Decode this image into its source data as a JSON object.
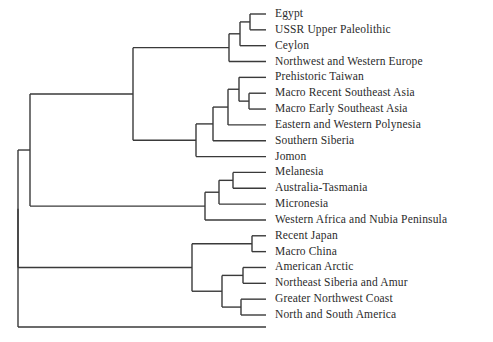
{
  "figure": {
    "type": "dendrogram",
    "orientation": "horizontal-right-facing",
    "background_color": "#ffffff",
    "line_color": "#3a3a3a",
    "text_color": "#2b2b2b",
    "leaf_count": 19
  },
  "leaves": [
    {
      "id": "egypt",
      "label": "Egypt"
    },
    {
      "id": "ussr-upper-paleolithic",
      "label": "USSR Upper Paleolithic"
    },
    {
      "id": "ceylon",
      "label": "Ceylon"
    },
    {
      "id": "northwest-and-western-europe",
      "label": "Northwest and Western Europe"
    },
    {
      "id": "prehistoric-taiwan",
      "label": "Prehistoric Taiwan"
    },
    {
      "id": "macro-recent-southeast-asia",
      "label": "Macro Recent Southeast Asia"
    },
    {
      "id": "macro-early-southeast-asia",
      "label": "Macro Early Southeast Asia"
    },
    {
      "id": "eastern-and-western-polynesia",
      "label": "Eastern and Western Polynesia"
    },
    {
      "id": "southern-siberia",
      "label": "Southern Siberia"
    },
    {
      "id": "jomon",
      "label": "Jomon"
    },
    {
      "id": "melanesia",
      "label": "Melanesia"
    },
    {
      "id": "australia-tasmania",
      "label": "Australia-Tasmania"
    },
    {
      "id": "micronesia",
      "label": "Micronesia"
    },
    {
      "id": "western-africa-and-nubia-peninsula",
      "label": "Western Africa and Nubia Peninsula"
    },
    {
      "id": "recent-japan",
      "label": "Recent Japan"
    },
    {
      "id": "macro-china",
      "label": "Macro China"
    },
    {
      "id": "american-arctic",
      "label": "American Arctic"
    },
    {
      "id": "northeast-siberia-and-amur",
      "label": "Northeast Siberia and Amur"
    },
    {
      "id": "greater-northwest-coast",
      "label": "Greater Northwest Coast"
    },
    {
      "id": "north-and-south-america",
      "label": "North and South America"
    }
  ],
  "chart_data": {
    "type": "dendrogram",
    "title": "",
    "xlabel": "",
    "ylabel": "",
    "leaf_order": [
      "Egypt",
      "USSR Upper Paleolithic",
      "Ceylon",
      "Northwest and Western Europe",
      "Prehistoric Taiwan",
      "Macro Recent Southeast Asia",
      "Macro Early Southeast Asia",
      "Eastern and Western Polynesia",
      "Southern Siberia",
      "Jomon",
      "Melanesia",
      "Australia-Tasmania",
      "Micronesia",
      "Western Africa and Nubia Peninsula",
      "Recent Japan",
      "Macro China",
      "American Arctic",
      "Northeast Siberia and Amur",
      "Greater Northwest Coast",
      "North and South America"
    ],
    "leaf_tip_x": 266,
    "leaf_y": [
      14,
      31,
      48,
      64,
      81,
      97,
      114,
      130,
      147,
      163,
      180,
      196,
      213,
      229,
      246,
      262,
      279,
      295,
      312,
      315
    ],
    "merges": [
      {
        "id": "n_egypt_ussr",
        "x": 250,
        "children": [
          "Egypt",
          "USSR Upper Paleolithic"
        ]
      },
      {
        "id": "n_ceylon",
        "x": 240,
        "children": [
          "n_egypt_ussr",
          "Ceylon"
        ]
      },
      {
        "id": "n_nweurope",
        "x": 229,
        "children": [
          "n_ceylon",
          "Northwest and Western Europe"
        ]
      },
      {
        "id": "n_sea_pair",
        "x": 249,
        "children": [
          "Macro Recent Southeast Asia",
          "Macro Early Southeast Asia"
        ]
      },
      {
        "id": "n_taiwan_sea",
        "x": 239,
        "children": [
          "Prehistoric Taiwan",
          "n_sea_pair"
        ]
      },
      {
        "id": "n_polynesia",
        "x": 228,
        "children": [
          "n_taiwan_sea",
          "Eastern and Western Polynesia"
        ]
      },
      {
        "id": "n_ssiberia",
        "x": 213,
        "children": [
          "n_polynesia",
          "Southern Siberia"
        ]
      },
      {
        "id": "n_jomon",
        "x": 196,
        "children": [
          "n_ssiberia",
          "Jomon"
        ]
      },
      {
        "id": "n_upper",
        "x": 133,
        "children": [
          "n_nweurope",
          "n_jomon"
        ]
      },
      {
        "id": "n_mel_aus",
        "x": 233,
        "children": [
          "Melanesia",
          "Australia-Tasmania"
        ]
      },
      {
        "id": "n_micronesia",
        "x": 219,
        "children": [
          "n_mel_aus",
          "Micronesia"
        ]
      },
      {
        "id": "n_wafrica",
        "x": 205,
        "children": [
          "n_micronesia",
          "Western Africa and Nubia Peninsula"
        ]
      },
      {
        "id": "n_clade_a",
        "x": 30,
        "children": [
          "n_upper",
          "n_wafrica"
        ]
      },
      {
        "id": "n_japan_china",
        "x": 252,
        "children": [
          "Recent Japan",
          "Macro China"
        ]
      },
      {
        "id": "n_arctic_siberia",
        "x": 243,
        "children": [
          "American Arctic",
          "Northeast Siberia and Amur"
        ]
      },
      {
        "id": "n_gnwcoast",
        "x": 241,
        "children": [
          "Greater Northwest Coast",
          "North and South America"
        ]
      },
      {
        "id": "n_arctic_group",
        "x": 222,
        "children": [
          "n_arctic_siberia",
          "n_gnwcoast"
        ]
      },
      {
        "id": "n_clade_b",
        "x": 192,
        "children": [
          "n_japan_china",
          "n_arctic_group"
        ]
      },
      {
        "id": "n_root",
        "x": 18,
        "children": [
          "n_clade_a",
          "n_clade_b"
        ]
      }
    ],
    "grid": false,
    "legend": null
  }
}
